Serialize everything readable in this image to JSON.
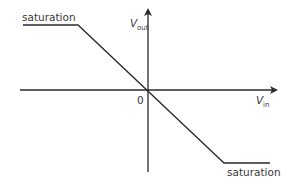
{
  "diagram": {
    "type": "transfer-characteristic",
    "colors": {
      "line": "#2a2a2a",
      "text": "#3a3a3a",
      "background": "#ffffff"
    },
    "axes": {
      "y": {
        "label_main": "V",
        "label_sub": "out"
      },
      "x": {
        "label_main": "V",
        "label_sub": "in"
      },
      "origin_label": "0"
    },
    "labels": {
      "saturation_top": "saturation",
      "saturation_bottom": "saturation"
    }
  }
}
